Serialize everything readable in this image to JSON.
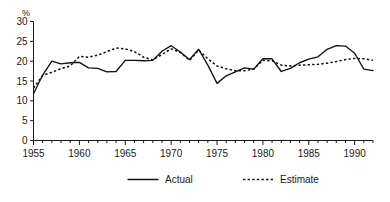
{
  "chart_data": {
    "type": "line",
    "title": "",
    "xlabel": "",
    "ylabel": "%",
    "ylim": [
      0,
      30
    ],
    "xlim": [
      1955,
      1992
    ],
    "yticks": [
      0,
      5,
      10,
      15,
      20,
      25,
      30
    ],
    "ytick_labels": [
      "0",
      "5",
      "10",
      "15",
      "20",
      "25",
      "30"
    ],
    "xticks": [
      1955,
      1960,
      1965,
      1970,
      1975,
      1980,
      1985,
      1990
    ],
    "xtick_labels": [
      "1955",
      "1960",
      "1965",
      "1970",
      "1975",
      "1980",
      "1985",
      "1990"
    ],
    "minor_xtick_interval": 1,
    "grid": false,
    "legend_position": "bottom-center",
    "x": [
      1955,
      1956,
      1957,
      1958,
      1959,
      1960,
      1961,
      1962,
      1963,
      1964,
      1965,
      1966,
      1967,
      1968,
      1969,
      1970,
      1971,
      1972,
      1973,
      1974,
      1975,
      1976,
      1977,
      1978,
      1979,
      1980,
      1981,
      1982,
      1983,
      1984,
      1985,
      1986,
      1987,
      1988,
      1989,
      1990,
      1991,
      1992
    ],
    "series": [
      {
        "name": "Actual",
        "style": "solid",
        "values": [
          11.8,
          16.5,
          20.0,
          19.3,
          19.6,
          19.7,
          18.3,
          18.2,
          17.3,
          17.4,
          20.2,
          20.2,
          20.1,
          20.2,
          22.5,
          23.9,
          22.3,
          20.4,
          23.0,
          19.0,
          14.4,
          16.3,
          17.3,
          18.3,
          18.0,
          20.6,
          20.6,
          17.4,
          18.2,
          19.6,
          20.5,
          21.1,
          23.0,
          23.9,
          23.8,
          22.0,
          18.0,
          17.6
        ]
      },
      {
        "name": "Estimate",
        "style": "dashed",
        "values": [
          13.2,
          16.4,
          17.2,
          18.1,
          18.8,
          21.2,
          21.0,
          21.5,
          22.4,
          23.3,
          23.1,
          22.4,
          21.0,
          20.3,
          21.7,
          23.1,
          22.2,
          20.2,
          22.8,
          20.6,
          18.8,
          18.1,
          17.6,
          17.6,
          18.0,
          20.2,
          20.1,
          19.0,
          18.8,
          19.0,
          19.1,
          19.2,
          19.5,
          19.9,
          20.4,
          20.7,
          20.6,
          20.2
        ]
      }
    ],
    "legend": [
      {
        "label": "Actual",
        "style": "solid"
      },
      {
        "label": "Estimate",
        "style": "dashed"
      }
    ],
    "colors": {
      "ink": "#111111",
      "background": "#ffffff"
    }
  }
}
